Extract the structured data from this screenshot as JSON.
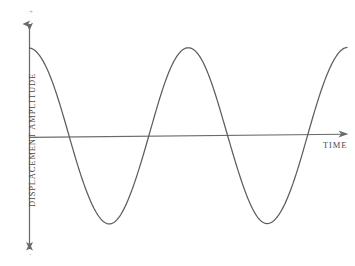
{
  "figure": {
    "kind": "line-diagram",
    "background_color": "#ffffff",
    "stroke_color": "#5d5d5d",
    "axis_color": "#6a6a6a",
    "label_color": "#4a4a4a"
  },
  "axes": {
    "y_label": "DISPLACEMENT AMPLITUDE",
    "x_label": "TIME",
    "positive_sign": "+",
    "negative_sign": "-"
  },
  "chart_data": {
    "type": "line",
    "title": "",
    "subtitle": "",
    "xlabel": "TIME",
    "ylabel": "DISPLACEMENT AMPLITUDE",
    "grid": false,
    "legend": "none",
    "xlim": [
      0,
      2.0
    ],
    "ylim": [
      -1.12,
      1.12
    ],
    "axis_ticks": {
      "x": [],
      "y": []
    },
    "annotations": [
      {
        "text": "+",
        "position": "top of y-axis",
        "x": 0.0,
        "y": 1.12
      },
      {
        "text": "-",
        "position": "bottom of y-axis",
        "x": 0.0,
        "y": -1.12
      },
      {
        "text": "TIME",
        "position": "right of x-axis arrow",
        "x": 2.0,
        "y": -0.05
      }
    ],
    "series": [
      {
        "name": "displacement",
        "function": "cosine",
        "amplitude": 1.0,
        "period": 1.0,
        "phase_deg": 0,
        "x": [
          0.0,
          0.0625,
          0.125,
          0.1875,
          0.25,
          0.3125,
          0.375,
          0.4375,
          0.5,
          0.5625,
          0.625,
          0.6875,
          0.75,
          0.8125,
          0.875,
          0.9375,
          1.0,
          1.0625,
          1.125,
          1.1875,
          1.25,
          1.3125,
          1.375,
          1.4375,
          1.5,
          1.5625,
          1.625,
          1.6875,
          1.75,
          1.8125,
          1.875,
          1.9375,
          2.0
        ],
        "values": [
          1.0,
          0.924,
          0.707,
          0.383,
          0.0,
          -0.383,
          -0.707,
          -0.924,
          -1.0,
          -0.924,
          -0.707,
          -0.383,
          0.0,
          0.383,
          0.707,
          0.924,
          1.0,
          0.924,
          0.707,
          0.383,
          0.0,
          -0.383,
          -0.707,
          -0.924,
          -1.0,
          -0.924,
          -0.707,
          -0.383,
          0.0,
          0.383,
          0.707,
          0.924,
          1.0
        ]
      }
    ],
    "key_points": {
      "peaks": [
        {
          "x": 0.0,
          "y": 1.0
        },
        {
          "x": 1.0,
          "y": 1.0
        },
        {
          "x": 2.0,
          "y": 1.0
        }
      ],
      "troughs": [
        {
          "x": 0.5,
          "y": -1.0
        },
        {
          "x": 1.5,
          "y": -1.0
        }
      ],
      "zero_crossings": [
        {
          "x": 0.25,
          "y": 0.0
        },
        {
          "x": 0.75,
          "y": 0.0
        },
        {
          "x": 1.25,
          "y": 0.0
        },
        {
          "x": 1.75,
          "y": 0.0
        }
      ]
    }
  }
}
